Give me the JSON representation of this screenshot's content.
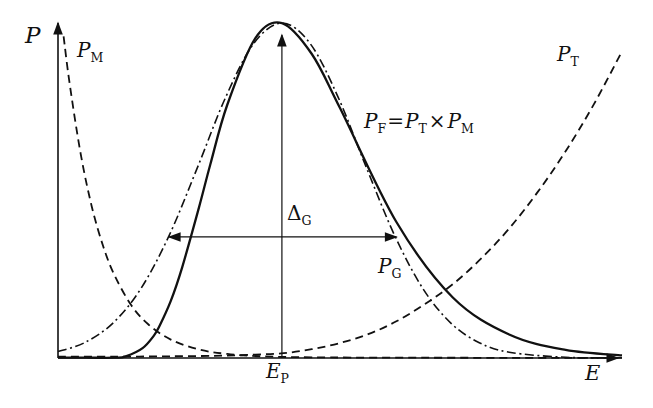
{
  "figure": {
    "background": "#ffffff",
    "ink": "#111111"
  },
  "labels": {
    "p_axis": "P",
    "e_axis": "E",
    "pm": {
      "base": "P",
      "sub": "M"
    },
    "pt": {
      "base": "P",
      "sub": "T"
    },
    "pg": {
      "base": "P",
      "sub": "G"
    },
    "pf_eq": {
      "lhs_base": "P",
      "lhs_sub": "F",
      "equals": "=",
      "rhs1_base": "P",
      "rhs1_sub": "T",
      "times": "×",
      "rhs2_base": "P",
      "rhs2_sub": "M"
    },
    "delta": {
      "base": "Δ",
      "sub": "G"
    },
    "e_peak": {
      "base": "E",
      "sub": "P"
    }
  },
  "chart_data": {
    "type": "line",
    "title": "",
    "xlabel": "E",
    "ylabel": "P",
    "x_axis": {
      "range": [
        0,
        1
      ],
      "ticks": [],
      "grid": false
    },
    "y_axis": {
      "range": [
        0,
        1
      ],
      "ticks": [],
      "grid": false
    },
    "legend": "none, curves labeled inline",
    "series": [
      {
        "name": "maxwell",
        "label": "P_M",
        "style": "dashed",
        "points": [
          [
            0.01,
            0.946
          ],
          [
            0.02,
            0.814
          ],
          [
            0.04,
            0.602
          ],
          [
            0.06,
            0.445
          ],
          [
            0.08,
            0.329
          ],
          [
            0.1,
            0.244
          ],
          [
            0.13,
            0.155
          ],
          [
            0.16,
            0.099
          ],
          [
            0.2,
            0.054
          ],
          [
            0.25,
            0.025
          ],
          [
            0.3,
            0.012
          ],
          [
            0.36,
            0.005
          ],
          [
            0.45,
            0.002
          ],
          [
            0.6,
            0.001
          ],
          [
            0.8,
            0.0005
          ],
          [
            1.0,
            0.0003
          ]
        ]
      },
      {
        "name": "tunneling",
        "label": "P_T",
        "style": "dashed",
        "points": [
          [
            0.0,
            0.004
          ],
          [
            0.1,
            0.004
          ],
          [
            0.2,
            0.005
          ],
          [
            0.3,
            0.007
          ],
          [
            0.35,
            0.01
          ],
          [
            0.4,
            0.014
          ],
          [
            0.45,
            0.026
          ],
          [
            0.5,
            0.044
          ],
          [
            0.55,
            0.07
          ],
          [
            0.6,
            0.108
          ],
          [
            0.65,
            0.158
          ],
          [
            0.7,
            0.217
          ],
          [
            0.75,
            0.292
          ],
          [
            0.8,
            0.381
          ],
          [
            0.85,
            0.487
          ],
          [
            0.9,
            0.608
          ],
          [
            0.95,
            0.746
          ],
          [
            1.0,
            0.902
          ]
        ]
      },
      {
        "name": "gaussian",
        "label": "P_G",
        "style": "dashdot",
        "points": [
          [
            0.0,
            0.019
          ],
          [
            0.047,
            0.045
          ],
          [
            0.097,
            0.102
          ],
          [
            0.147,
            0.204
          ],
          [
            0.197,
            0.36
          ],
          [
            0.247,
            0.559
          ],
          [
            0.297,
            0.766
          ],
          [
            0.347,
            0.925
          ],
          [
            0.397,
            0.985
          ],
          [
            0.447,
            0.925
          ],
          [
            0.497,
            0.766
          ],
          [
            0.547,
            0.559
          ],
          [
            0.597,
            0.36
          ],
          [
            0.647,
            0.204
          ],
          [
            0.697,
            0.102
          ],
          [
            0.747,
            0.045
          ],
          [
            0.8,
            0.017
          ],
          [
            0.9,
            0.002
          ],
          [
            1.0,
            0.0005
          ]
        ]
      },
      {
        "name": "gamow-peak",
        "label": "P_F = P_T × P_M",
        "style": "solid",
        "points": [
          [
            0.0,
            0.001
          ],
          [
            0.05,
            0.001
          ],
          [
            0.1,
            0.001
          ],
          [
            0.12,
            0.005
          ],
          [
            0.15,
            0.029
          ],
          [
            0.17,
            0.066
          ],
          [
            0.18,
            0.094
          ],
          [
            0.2,
            0.168
          ],
          [
            0.22,
            0.266
          ],
          [
            0.25,
            0.443
          ],
          [
            0.27,
            0.569
          ],
          [
            0.3,
            0.744
          ],
          [
            0.35,
            0.941
          ],
          [
            0.397,
            0.985
          ],
          [
            0.45,
            0.894
          ],
          [
            0.5,
            0.735
          ],
          [
            0.6,
            0.4
          ],
          [
            0.7,
            0.178
          ],
          [
            0.8,
            0.069
          ],
          [
            0.9,
            0.024
          ],
          [
            1.0,
            0.008
          ]
        ]
      }
    ],
    "annotations": {
      "peak_line": {
        "E": 0.397,
        "P_top": 0.95,
        "label": "E_P",
        "arrow": "up"
      },
      "width_arrow": {
        "P": 0.356,
        "E_from": 0.197,
        "E_to": 0.6,
        "label": "Δ_G",
        "arrow": "double-headed-horizontal"
      }
    }
  }
}
